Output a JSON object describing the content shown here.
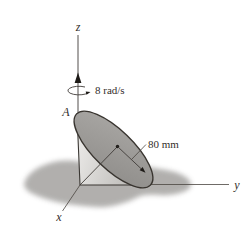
{
  "figure": {
    "axes": {
      "z": "z",
      "y": "y",
      "x": "x"
    },
    "point_label": "A",
    "angular_velocity_label": "8 rad/s",
    "radius_label": "80 mm",
    "values": {
      "angular_velocity_rad_s": 8,
      "radius_mm": 80
    },
    "colors": {
      "background": "#ffffff",
      "shadow": "#a9a7a5",
      "cone_light": "#f1f0ee",
      "cone_dark": "#bcbab7",
      "disc_light": "#aaa8a5",
      "disc_dark": "#8e8c89",
      "line": "#3f3b38",
      "text": "#332e2a"
    }
  }
}
